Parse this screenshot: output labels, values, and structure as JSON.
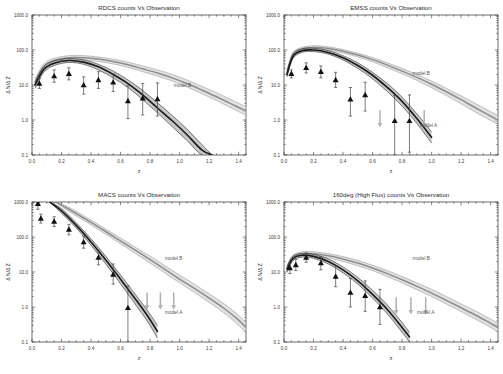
{
  "figure": {
    "name": "cluster-counts-vs-observation-panels",
    "background": "#ffffff",
    "rows": 2,
    "cols": 2
  },
  "common": {
    "xlabel": "z",
    "ylabel": "Δ N/Δ Z",
    "xticks": [
      "0.0",
      "0.2",
      "0.4",
      "0.6",
      "0.8",
      "1.0",
      "1.2",
      "1.4"
    ],
    "xtick_values": [
      0.0,
      0.2,
      0.4,
      0.6,
      0.8,
      1.0,
      1.2,
      1.4
    ],
    "yticks": [
      "1000.0",
      "100.0",
      "10.0",
      "1.0",
      "0.1"
    ],
    "ytick_values": [
      1000.0,
      100.0,
      10.0,
      1.0,
      0.1
    ],
    "xlim": [
      0.0,
      1.45
    ],
    "ylim": [
      0.1,
      1000.0
    ],
    "yscale": "log",
    "model_a_label": "model A",
    "model_b_label": "model B",
    "colors": {
      "axis": "#2b2b2b",
      "marker": "#111111",
      "errorbar": "#444444",
      "model_a_band": "#9a9a9a",
      "model_a_line": "#1a1a1a",
      "model_b_band": "#c9c9c9",
      "model_b_line": "#8d8d8d",
      "arrow": "#b0b0b0",
      "text": "#2b2b2b"
    }
  },
  "chart_data": [
    {
      "id": "rdcs",
      "type": "scatter",
      "title": "RDCS counts Vs Observation",
      "xlabel": "z",
      "ylabel": "Δ N/Δ Z",
      "xlim": [
        0.0,
        1.45
      ],
      "ylim": [
        0.1,
        1000.0
      ],
      "yscale": "log",
      "grid": false,
      "legend_position": "inside-right",
      "annotations": [
        {
          "text": "model B",
          "x": 1.02,
          "y": 9.0
        }
      ],
      "points": [
        {
          "x": 0.05,
          "y": 11.0,
          "yerr_lo": 8.0,
          "yerr_hi": 15.5
        },
        {
          "x": 0.15,
          "y": 18.0,
          "yerr_lo": 12.0,
          "yerr_hi": 27.0
        },
        {
          "x": 0.25,
          "y": 21.0,
          "yerr_lo": 14.0,
          "yerr_hi": 31.0
        },
        {
          "x": 0.35,
          "y": 10.0,
          "yerr_lo": 5.5,
          "yerr_hi": 17.0
        },
        {
          "x": 0.45,
          "y": 14.0,
          "yerr_lo": 8.0,
          "yerr_hi": 24.0
        },
        {
          "x": 0.55,
          "y": 12.0,
          "yerr_lo": 6.5,
          "yerr_hi": 21.0
        },
        {
          "x": 0.65,
          "y": 3.5,
          "yerr_lo": 1.1,
          "yerr_hi": 9.5
        },
        {
          "x": 0.75,
          "y": 4.2,
          "yerr_lo": 1.4,
          "yerr_hi": 11.0
        },
        {
          "x": 0.85,
          "y": 4.0,
          "yerr_lo": 1.3,
          "yerr_hi": 11.5
        }
      ],
      "model_a": {
        "name": "model A",
        "x": [
          0.02,
          0.08,
          0.15,
          0.25,
          0.35,
          0.45,
          0.55,
          0.65,
          0.75,
          0.85,
          0.95,
          1.05,
          1.15,
          1.22
        ],
        "y": [
          10.0,
          28.0,
          42.0,
          50.0,
          45.0,
          33.0,
          20.0,
          11.0,
          5.2,
          2.2,
          0.95,
          0.38,
          0.14,
          0.1
        ],
        "band_lo": [
          8.0,
          23.0,
          36.0,
          44.0,
          39.0,
          27.0,
          16.0,
          8.5,
          3.8,
          1.6,
          0.65,
          0.26,
          0.1,
          0.1
        ],
        "band_hi": [
          12.5,
          34.0,
          49.0,
          57.0,
          52.0,
          39.0,
          25.0,
          14.0,
          7.0,
          3.1,
          1.35,
          0.55,
          0.2,
          0.1
        ]
      },
      "model_b": {
        "name": "model B",
        "x": [
          0.02,
          0.08,
          0.15,
          0.25,
          0.35,
          0.45,
          0.55,
          0.65,
          0.75,
          0.85,
          0.95,
          1.05,
          1.15,
          1.25,
          1.35,
          1.45
        ],
        "y": [
          12.0,
          33.0,
          50.0,
          60.0,
          60.0,
          55.0,
          47.0,
          38.0,
          29.0,
          22.0,
          16.0,
          11.0,
          7.2,
          4.6,
          2.9,
          1.8
        ],
        "band_lo": [
          9.5,
          27.0,
          43.0,
          52.0,
          52.0,
          47.0,
          40.0,
          32.0,
          24.0,
          18.0,
          13.0,
          8.8,
          5.7,
          3.6,
          2.2,
          1.35
        ],
        "band_hi": [
          15.0,
          40.0,
          58.0,
          69.0,
          69.0,
          63.0,
          55.0,
          45.0,
          35.0,
          27.0,
          20.0,
          14.0,
          9.2,
          6.0,
          3.8,
          2.4
        ]
      },
      "upper_limits": []
    },
    {
      "id": "emss",
      "type": "scatter",
      "title": "EMSS counts Vs Observation",
      "xlabel": "z",
      "ylabel": "Δ N/Δ Z",
      "xlim": [
        0.0,
        1.45
      ],
      "ylim": [
        0.1,
        1000.0
      ],
      "yscale": "log",
      "grid": false,
      "legend_position": "inside-right",
      "annotations": [
        {
          "text": "model B",
          "x": 0.93,
          "y": 19.0
        },
        {
          "text": "model A",
          "x": 0.98,
          "y": 0.62
        }
      ],
      "points": [
        {
          "x": 0.05,
          "y": 21.0,
          "yerr_lo": 16.0,
          "yerr_hi": 27.0
        },
        {
          "x": 0.15,
          "y": 31.0,
          "yerr_lo": 22.0,
          "yerr_hi": 43.0
        },
        {
          "x": 0.25,
          "y": 24.0,
          "yerr_lo": 16.0,
          "yerr_hi": 35.0
        },
        {
          "x": 0.35,
          "y": 14.0,
          "yerr_lo": 8.5,
          "yerr_hi": 23.0
        },
        {
          "x": 0.45,
          "y": 3.9,
          "yerr_lo": 1.3,
          "yerr_hi": 8.5
        },
        {
          "x": 0.55,
          "y": 5.2,
          "yerr_lo": 1.8,
          "yerr_hi": 12.0
        },
        {
          "x": 0.75,
          "y": 0.95,
          "yerr_lo": 0.1,
          "yerr_hi": 5.0
        },
        {
          "x": 0.85,
          "y": 0.95,
          "yerr_lo": 0.12,
          "yerr_hi": 5.2
        }
      ],
      "model_a": {
        "name": "model A",
        "x": [
          0.02,
          0.06,
          0.12,
          0.2,
          0.3,
          0.4,
          0.5,
          0.6,
          0.7,
          0.8,
          0.9,
          1.0
        ],
        "y": [
          20.0,
          65.0,
          95.0,
          100.0,
          85.0,
          60.0,
          36.0,
          19.0,
          8.5,
          3.4,
          1.1,
          0.32
        ],
        "band_lo": [
          17.0,
          56.0,
          85.0,
          90.0,
          76.0,
          52.0,
          30.0,
          15.0,
          6.5,
          2.5,
          0.8,
          0.22
        ],
        "band_hi": [
          24.0,
          76.0,
          108.0,
          112.0,
          96.0,
          69.0,
          43.0,
          23.0,
          11.0,
          4.5,
          1.5,
          0.46
        ]
      },
      "model_b": {
        "name": "model B",
        "x": [
          0.02,
          0.06,
          0.12,
          0.2,
          0.3,
          0.4,
          0.5,
          0.6,
          0.7,
          0.8,
          0.9,
          1.0,
          1.1,
          1.2,
          1.3,
          1.45
        ],
        "y": [
          22.0,
          72.0,
          105.0,
          118.0,
          110.0,
          92.0,
          72.0,
          53.0,
          37.0,
          25.0,
          16.5,
          10.5,
          6.4,
          3.8,
          2.2,
          1.0
        ],
        "band_lo": [
          18.0,
          62.0,
          94.0,
          106.0,
          99.0,
          82.0,
          63.0,
          46.0,
          31.0,
          21.0,
          13.5,
          8.4,
          5.0,
          2.9,
          1.65,
          0.75
        ],
        "band_hi": [
          27.0,
          84.0,
          118.0,
          132.0,
          123.0,
          103.0,
          81.0,
          61.0,
          43.0,
          30.0,
          20.0,
          13.0,
          8.0,
          4.9,
          2.9,
          1.35
        ]
      },
      "upper_limits": [
        {
          "x": 0.65,
          "y": 1.9
        },
        {
          "x": 0.95,
          "y": 1.9
        }
      ]
    },
    {
      "id": "macs",
      "type": "scatter",
      "title": "MACS counts Vs Observation",
      "xlabel": "z",
      "ylabel": "Δ N/Δ Z",
      "xlim": [
        0.0,
        1.45
      ],
      "ylim": [
        0.1,
        1000.0
      ],
      "yscale": "log",
      "grid": false,
      "legend_position": "inside-right",
      "annotations": [
        {
          "text": "model B",
          "x": 0.96,
          "y": 22.0
        },
        {
          "text": "model A",
          "x": 0.96,
          "y": 0.62
        }
      ],
      "points": [
        {
          "x": 0.04,
          "y": 900.0,
          "yerr_lo": 620.0,
          "yerr_hi": 1000.0
        },
        {
          "x": 0.06,
          "y": 340.0,
          "yerr_lo": 250.0,
          "yerr_hi": 450.0
        },
        {
          "x": 0.15,
          "y": 280.0,
          "yerr_lo": 200.0,
          "yerr_hi": 380.0
        },
        {
          "x": 0.25,
          "y": 165.0,
          "yerr_lo": 115.0,
          "yerr_hi": 230.0
        },
        {
          "x": 0.35,
          "y": 72.0,
          "yerr_lo": 48.0,
          "yerr_hi": 105.0
        },
        {
          "x": 0.45,
          "y": 26.0,
          "yerr_lo": 16.0,
          "yerr_hi": 40.0
        },
        {
          "x": 0.55,
          "y": 8.5,
          "yerr_lo": 4.5,
          "yerr_hi": 17.0
        },
        {
          "x": 0.65,
          "y": 0.95,
          "yerr_lo": 0.1,
          "yerr_hi": 4.0
        }
      ],
      "model_a": {
        "name": "model A",
        "x": [
          0.12,
          0.2,
          0.3,
          0.4,
          0.5,
          0.6,
          0.7,
          0.78,
          0.85
        ],
        "y": [
          1000.0,
          560.0,
          215.0,
          72.0,
          22.0,
          6.2,
          1.7,
          0.58,
          0.2
        ],
        "band_lo": [
          1000.0,
          480.0,
          180.0,
          58.0,
          17.0,
          4.6,
          1.2,
          0.4,
          0.13
        ],
        "band_hi": [
          1000.0,
          650.0,
          255.0,
          89.0,
          28.0,
          8.2,
          2.3,
          0.82,
          0.3
        ]
      },
      "model_b": {
        "name": "model B",
        "x": [
          0.16,
          0.25,
          0.4,
          0.55,
          0.7,
          0.85,
          1.0,
          1.1,
          1.2,
          1.3,
          1.4,
          1.45
        ],
        "y": [
          1000.0,
          620.0,
          260.0,
          105.0,
          42.0,
          16.5,
          6.3,
          3.4,
          1.8,
          0.92,
          0.42,
          0.26
        ],
        "band_lo": [
          1000.0,
          540.0,
          222.0,
          88.0,
          34.0,
          13.0,
          4.9,
          2.6,
          1.35,
          0.68,
          0.3,
          0.18
        ],
        "band_hi": [
          1000.0,
          710.0,
          305.0,
          125.0,
          51.0,
          21.0,
          8.2,
          4.5,
          2.4,
          1.25,
          0.58,
          0.36
        ]
      },
      "upper_limits": [
        {
          "x": 0.78,
          "y": 2.6
        },
        {
          "x": 0.87,
          "y": 2.6
        },
        {
          "x": 0.96,
          "y": 2.6
        }
      ]
    },
    {
      "id": "160deg",
      "type": "scatter",
      "title": "160deg (High Flux) counts Vs Observation",
      "xlabel": "z",
      "ylabel": "Δ N/Δ Z",
      "xlim": [
        0.0,
        1.45
      ],
      "ylim": [
        0.1,
        1000.0
      ],
      "yscale": "log",
      "grid": false,
      "legend_position": "inside-right",
      "annotations": [
        {
          "text": "model B",
          "x": 0.93,
          "y": 22.0
        },
        {
          "text": "model A",
          "x": 0.96,
          "y": 0.62
        }
      ],
      "points": [
        {
          "x": 0.04,
          "y": 13.0,
          "yerr_lo": 9.0,
          "yerr_hi": 18.0
        },
        {
          "x": 0.08,
          "y": 16.0,
          "yerr_lo": 11.0,
          "yerr_hi": 23.0
        },
        {
          "x": 0.15,
          "y": 26.0,
          "yerr_lo": 19.0,
          "yerr_hi": 35.0
        },
        {
          "x": 0.25,
          "y": 18.0,
          "yerr_lo": 11.5,
          "yerr_hi": 27.0
        },
        {
          "x": 0.35,
          "y": 7.5,
          "yerr_lo": 3.8,
          "yerr_hi": 15.0
        },
        {
          "x": 0.45,
          "y": 2.6,
          "yerr_lo": 1.0,
          "yerr_hi": 6.5
        },
        {
          "x": 0.55,
          "y": 2.1,
          "yerr_lo": 0.75,
          "yerr_hi": 5.6
        },
        {
          "x": 0.65,
          "y": 1.0,
          "yerr_lo": 0.32,
          "yerr_hi": 3.2
        }
      ],
      "model_a": {
        "name": "model A",
        "x": [
          0.02,
          0.06,
          0.12,
          0.2,
          0.3,
          0.4,
          0.5,
          0.6,
          0.7,
          0.8,
          0.85
        ],
        "y": [
          12.0,
          24.0,
          30.0,
          28.0,
          20.0,
          11.5,
          5.6,
          2.3,
          0.85,
          0.26,
          0.14
        ],
        "band_lo": [
          10.0,
          21.0,
          26.5,
          24.5,
          17.0,
          9.5,
          4.5,
          1.8,
          0.64,
          0.19,
          0.1
        ],
        "band_hi": [
          14.5,
          28.0,
          34.0,
          32.0,
          23.5,
          14.0,
          7.0,
          3.0,
          1.15,
          0.36,
          0.19
        ]
      },
      "model_b": {
        "name": "model B",
        "x": [
          0.02,
          0.06,
          0.12,
          0.2,
          0.3,
          0.4,
          0.5,
          0.6,
          0.7,
          0.8,
          0.9,
          1.0,
          1.1,
          1.2,
          1.3,
          1.4,
          1.45
        ],
        "y": [
          13.0,
          26.0,
          33.0,
          33.0,
          29.0,
          23.5,
          18.0,
          13.0,
          9.0,
          6.0,
          3.9,
          2.5,
          1.55,
          0.95,
          0.58,
          0.34,
          0.26
        ],
        "band_lo": [
          11.0,
          23.0,
          29.0,
          29.0,
          25.0,
          20.0,
          15.0,
          11.0,
          7.4,
          4.9,
          3.1,
          2.0,
          1.22,
          0.74,
          0.44,
          0.26,
          0.19
        ],
        "band_hi": [
          15.5,
          30.0,
          38.0,
          38.0,
          33.5,
          27.5,
          21.5,
          15.5,
          11.0,
          7.4,
          4.9,
          3.2,
          2.0,
          1.22,
          0.76,
          0.45,
          0.34
        ]
      },
      "upper_limits": [
        {
          "x": 0.76,
          "y": 1.9
        },
        {
          "x": 0.86,
          "y": 1.9
        },
        {
          "x": 0.96,
          "y": 1.9
        }
      ]
    }
  ]
}
